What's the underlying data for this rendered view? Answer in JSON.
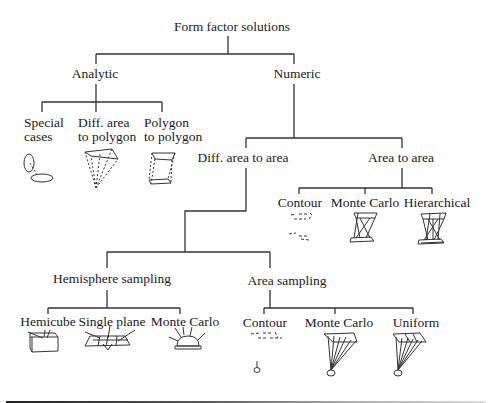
{
  "diagram": {
    "title": "Form factor solutions",
    "nodes": {
      "root": "Form factor solutions",
      "analytic": "Analytic",
      "numeric": "Numeric",
      "special_cases": [
        "Special",
        "cases"
      ],
      "diff_area_to_polygon": [
        "Diff. area",
        "to polygon"
      ],
      "polygon_to_polygon": [
        "Polygon",
        "to polygon"
      ],
      "diff_area_to_area": "Diff. area to area",
      "area_to_area": "Area to area",
      "ata_contour": "Contour",
      "ata_monte_carlo": "Monte Carlo",
      "ata_hierarchical": "Hierarchical",
      "hemisphere_sampling": "Hemisphere sampling",
      "area_sampling": "Area sampling",
      "hemicube": "Hemicube",
      "single_plane": "Single plane",
      "hs_monte_carlo": "Monte Carlo",
      "as_contour": "Contour",
      "as_monte_carlo": "Monte Carlo",
      "as_uniform": "Uniform"
    },
    "edges": [
      [
        "Form factor solutions",
        "Analytic"
      ],
      [
        "Form factor solutions",
        "Numeric"
      ],
      [
        "Analytic",
        "Special cases"
      ],
      [
        "Analytic",
        "Diff. area to polygon"
      ],
      [
        "Analytic",
        "Polygon to polygon"
      ],
      [
        "Numeric",
        "Diff. area to area"
      ],
      [
        "Numeric",
        "Area to area"
      ],
      [
        "Area to area",
        "Contour"
      ],
      [
        "Area to area",
        "Monte Carlo"
      ],
      [
        "Area to area",
        "Hierarchical"
      ],
      [
        "Diff. area to area",
        "Hemisphere sampling"
      ],
      [
        "Diff. area to area",
        "Area sampling"
      ],
      [
        "Hemisphere sampling",
        "Hemicube"
      ],
      [
        "Hemisphere sampling",
        "Single plane"
      ],
      [
        "Hemisphere sampling",
        "Monte Carlo"
      ],
      [
        "Area sampling",
        "Contour"
      ],
      [
        "Area sampling",
        "Monte Carlo"
      ],
      [
        "Area sampling",
        "Uniform"
      ]
    ],
    "line_color": "#333333"
  }
}
